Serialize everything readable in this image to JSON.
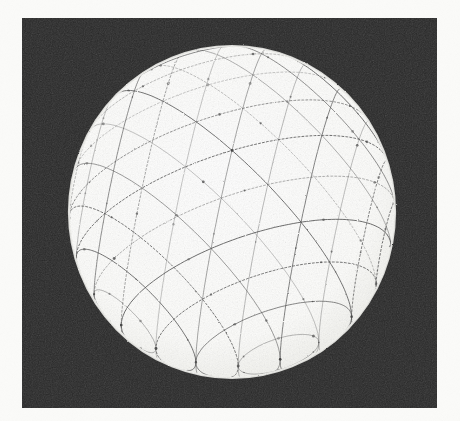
{
  "figure": {
    "description": "A white sphere rendered on a dark rectangular background, overlaid with a triangular geodesic mesh formed by three families of great-circle arcs.",
    "background_color": "#262626",
    "sphere_color": "#fdfdfb",
    "mesh_color": "#4a4a4a",
    "page_color": "#fbfbf9"
  },
  "panel": {
    "x": 22,
    "y": 18,
    "width": 415,
    "height": 390
  },
  "chart_data": {
    "type": "scatter",
    "xlabel": "",
    "ylabel": "",
    "projection": "orthographic",
    "grid": true,
    "legend": "none",
    "sphere": {
      "center_x": 210,
      "center_y": 194,
      "radius_x": 163,
      "radius_y": 166,
      "fill": "#fdfdfb"
    },
    "mesh": {
      "families": 3,
      "family_rotations_deg": [
        0,
        60,
        120
      ],
      "lines_per_family": 13,
      "spacing_deg": 15,
      "stroke": "#4a4a4a",
      "stroke_width": 1.0,
      "dash_pattern": "2 2",
      "vertex_count_visible": 84
    },
    "x": [],
    "values": [],
    "categories": []
  }
}
